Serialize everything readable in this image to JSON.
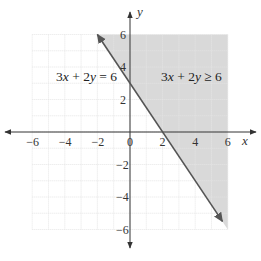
{
  "chart_data": {
    "type": "line",
    "title": "",
    "xlabel": "x",
    "ylabel": "y",
    "xlim": [
      -6,
      6
    ],
    "ylim": [
      -6,
      6
    ],
    "grid": true,
    "x_ticks": [
      -6,
      -4,
      -2,
      0,
      2,
      4,
      6
    ],
    "y_ticks": [
      -6,
      -4,
      -2,
      2,
      4,
      6
    ],
    "x_tick_labels": [
      "−6",
      "−4",
      "−2",
      "0",
      "2",
      "4",
      "6"
    ],
    "y_tick_labels": [
      "−6",
      "−4",
      "−2",
      "2",
      "4",
      "6"
    ],
    "series": [
      {
        "name": "3x + 2y = 6",
        "kind": "boundary-line",
        "style": "solid",
        "x": [
          -2,
          5.67
        ],
        "y": [
          6,
          -5.5
        ],
        "arrows": "both"
      }
    ],
    "shaded_region": {
      "name": "3x + 2y ≥ 6",
      "polygon": [
        [
          -2,
          6
        ],
        [
          6,
          6
        ],
        [
          6,
          -6
        ]
      ],
      "color": "#d9d9d9"
    },
    "annotations": [
      {
        "text": "3x + 2y = 6",
        "x": -4.5,
        "y": 3.3
      },
      {
        "text": "3x + 2y ≥ 6",
        "x": 3.5,
        "y": 3.3
      }
    ]
  },
  "labels": {
    "x_axis": "x",
    "y_axis": "y",
    "line_eq": "3x + 2y = 6",
    "region_eq": "3x + 2y ≥ 6",
    "origin": "0"
  },
  "colors": {
    "grid": "#e4e4e4",
    "shade": "#d9d9d9",
    "axis": "#333333",
    "line": "#555555"
  }
}
